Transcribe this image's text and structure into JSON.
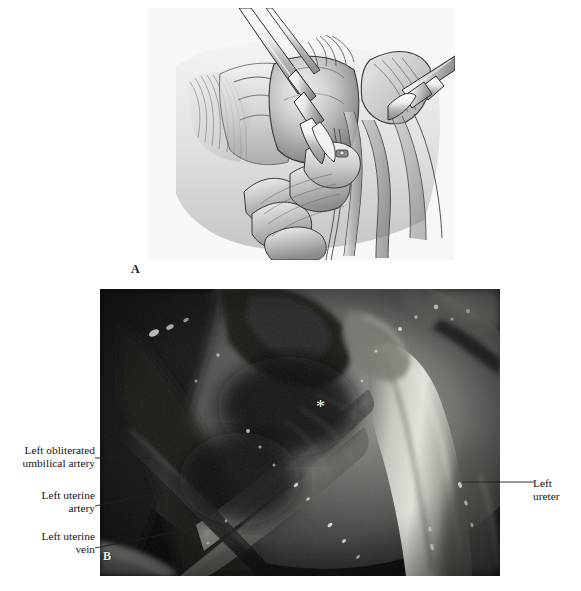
{
  "figure": {
    "panels": [
      {
        "id": "A",
        "label": "A",
        "type": "line-illustration",
        "description": "Grayscale surgical line drawing of pelvic sidewall dissection with two instruments retracting tissue"
      },
      {
        "id": "B",
        "label": "B",
        "type": "photograph",
        "description": "Intraoperative photograph of the left pelvic sidewall showing vascular anatomy"
      }
    ]
  },
  "annotations": {
    "umbilical_artery": {
      "line1": "Left obliterated",
      "line2": "umbilical artery"
    },
    "uterine_artery": {
      "line1": "Left uterine",
      "line2": "artery"
    },
    "uterine_vein": {
      "line1": "Left uterine",
      "line2": "vein"
    },
    "ureter": {
      "line1": "Left ureter"
    },
    "asterisk": {
      "marker": "*"
    }
  },
  "colors": {
    "page_background": "#ffffff",
    "text": "#141414",
    "leader_line": "#1f1f1f",
    "panel_a_background": "#f4f4f2",
    "panel_b_background": "#0a0a0a",
    "marker": "#ffffff"
  }
}
